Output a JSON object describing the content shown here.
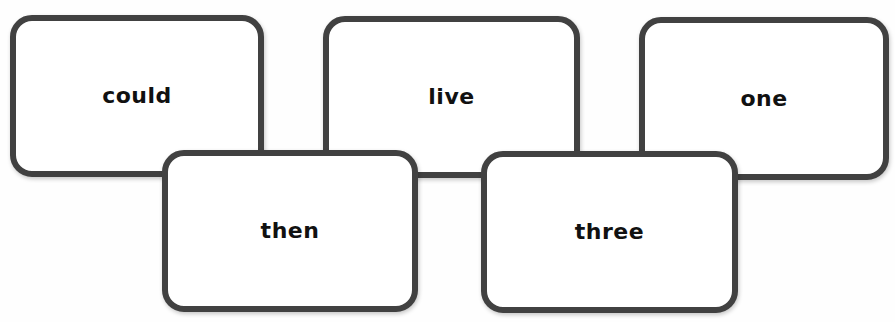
{
  "colors": {
    "card_border": "#414141",
    "card_fill": "#ffffff",
    "text": "#111111",
    "background": "#fefefe"
  },
  "cards": {
    "top": [
      {
        "word": "could"
      },
      {
        "word": "live"
      },
      {
        "word": "one"
      }
    ],
    "bottom": [
      {
        "word": "then"
      },
      {
        "word": "three"
      }
    ]
  }
}
